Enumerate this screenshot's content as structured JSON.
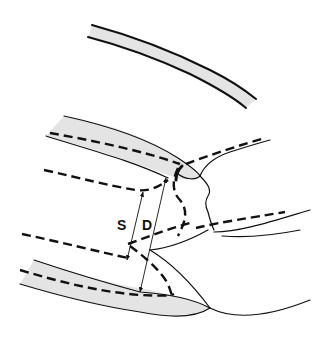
{
  "figure": {
    "type": "line-diagram",
    "labels": {
      "s": "S",
      "d": "D"
    },
    "colors": {
      "line": "#111111",
      "shaded_band": "#e4e4e4",
      "background": "#ffffff"
    }
  }
}
